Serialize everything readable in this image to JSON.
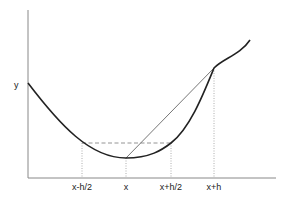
{
  "diagram": {
    "y_axis_label": "y",
    "x_ticks": [
      {
        "label": "x-h/2",
        "px": 82
      },
      {
        "label": "x",
        "px": 126
      },
      {
        "label": "x+h/2",
        "px": 171
      },
      {
        "label": "x+h",
        "px": 214
      }
    ],
    "colors": {
      "axis": "#888888",
      "curve": "#222222",
      "chord": "#666666",
      "dashed": "#888888",
      "guides": "#999999",
      "text": "#222222"
    }
  }
}
